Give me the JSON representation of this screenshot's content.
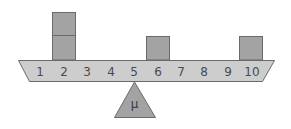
{
  "diagram": {
    "beam": {
      "positions": [
        "1",
        "2",
        "3",
        "4",
        "5",
        "6",
        "7",
        "8",
        "9",
        "10"
      ],
      "fill": "#cdcdcd",
      "stroke": "#6a6a6a"
    },
    "weights": [
      {
        "position": 2,
        "count": 2
      },
      {
        "position": 6,
        "count": 1
      },
      {
        "position": 10,
        "count": 1
      }
    ],
    "weight_fill": "#a3a3a3",
    "weight_stroke": "#6a6a6a",
    "fulcrum": {
      "label": "μ",
      "position": 5,
      "fill": "#a3a3a3",
      "stroke": "#6a6a6a"
    }
  }
}
